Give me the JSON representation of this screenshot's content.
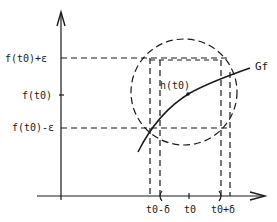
{
  "diagram": {
    "type": "continuity-epsilon-delta-illustration",
    "y_labels": {
      "upper": "f(t0)+ε",
      "middle": "f(t0)",
      "lower": "f(t0)-ε"
    },
    "x_labels": {
      "left": "t0-δ",
      "center": "t0",
      "right": "t0+δ"
    },
    "curve_label": "Gf",
    "point_label": "h(t0)",
    "colors": {
      "ink": "#1a1a1a",
      "background": "#ffffff"
    }
  }
}
